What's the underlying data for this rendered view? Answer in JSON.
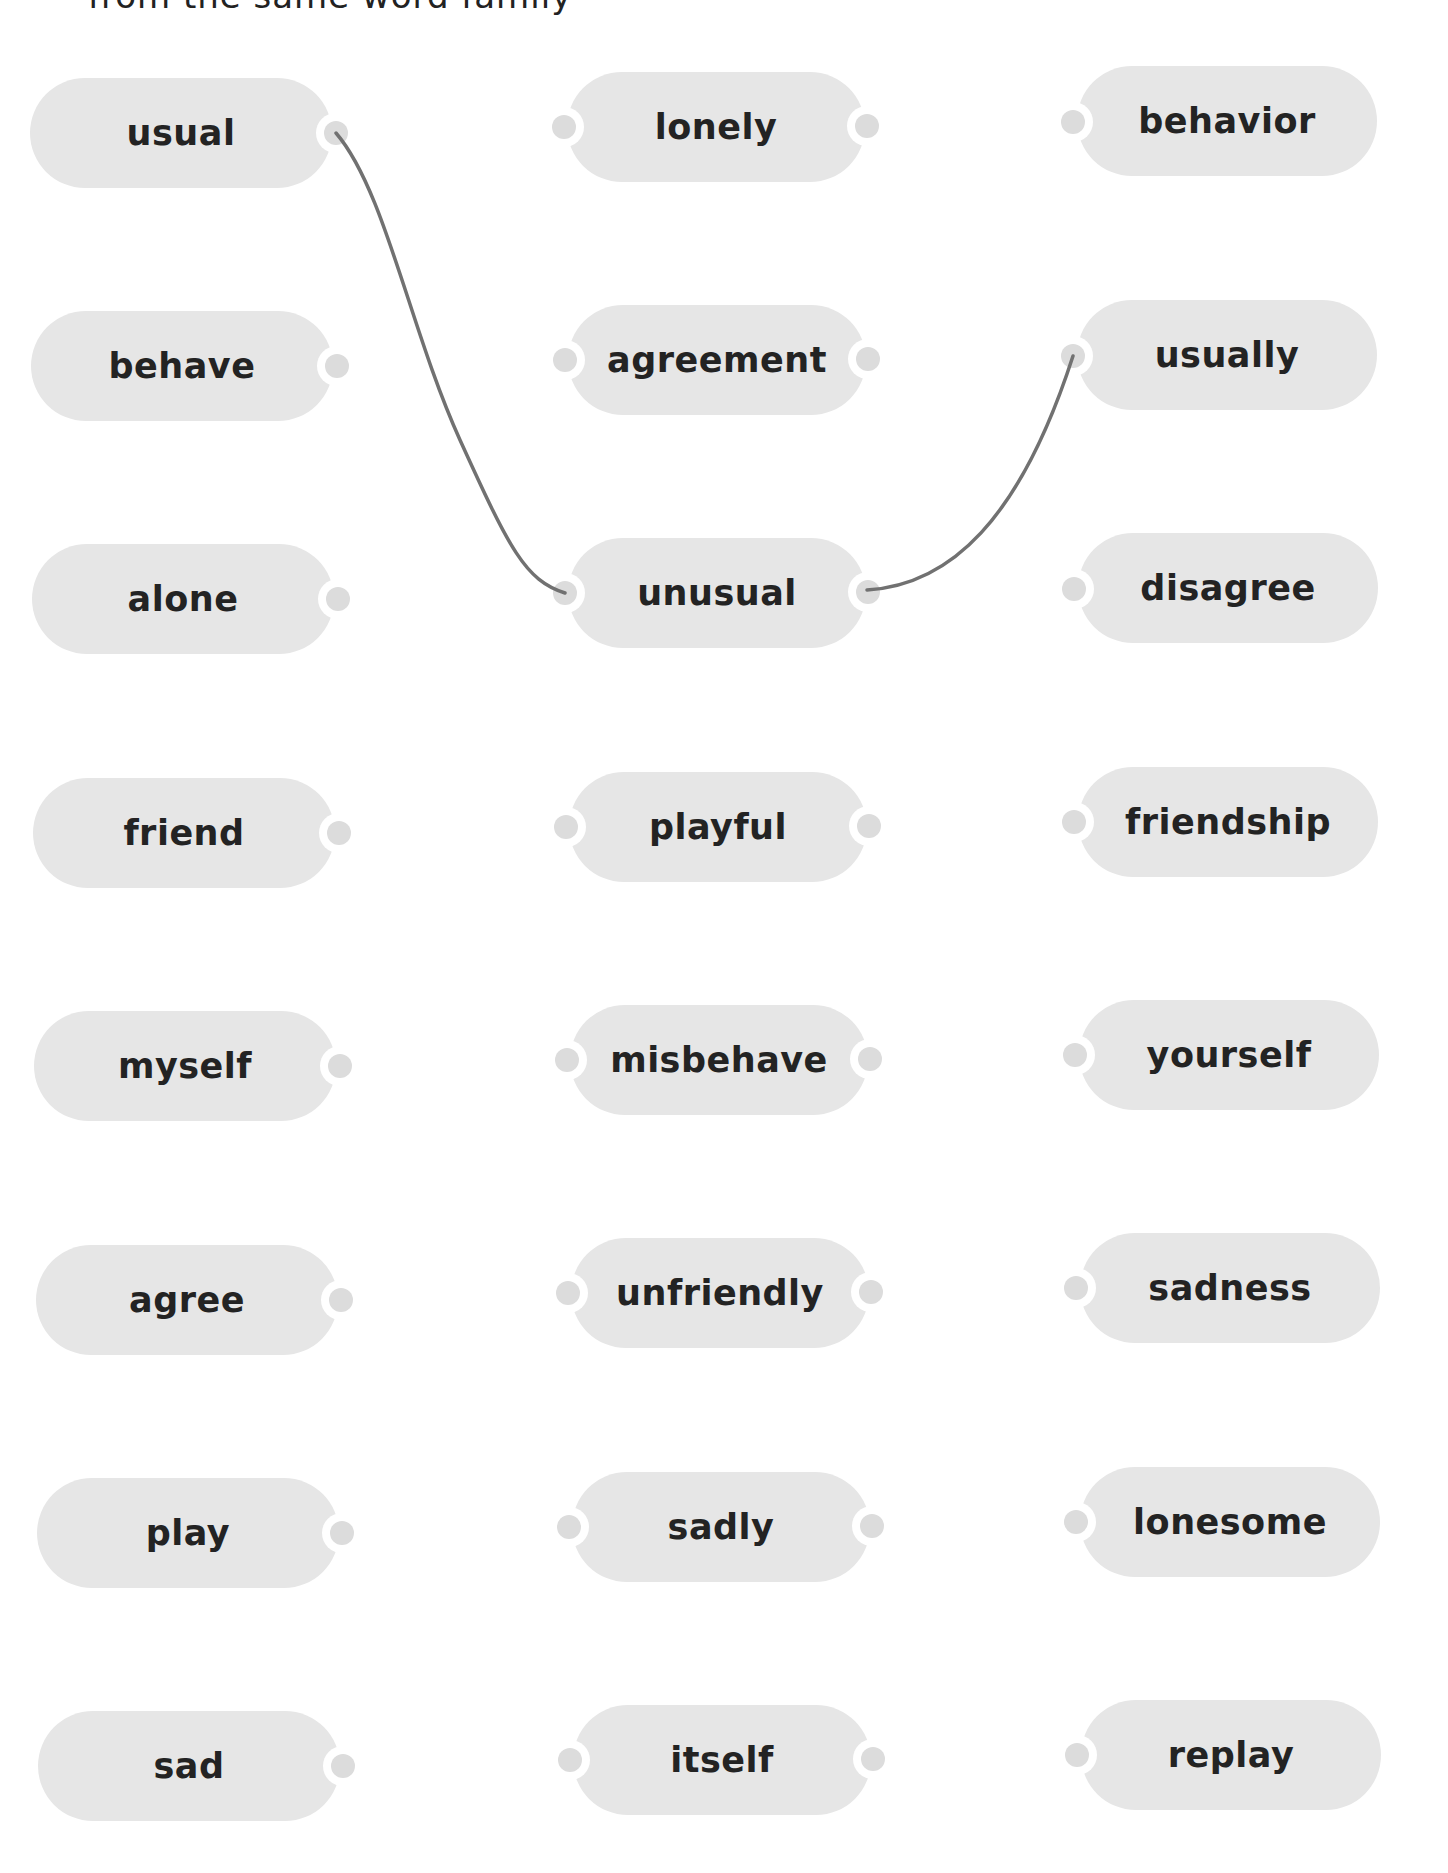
{
  "instruction": "from the same word family",
  "columns": {
    "left": [
      {
        "word": "usual"
      },
      {
        "word": "behave"
      },
      {
        "word": "alone"
      },
      {
        "word": "friend"
      },
      {
        "word": "myself"
      },
      {
        "word": "agree"
      },
      {
        "word": "play"
      },
      {
        "word": "sad"
      }
    ],
    "middle": [
      {
        "word": "lonely"
      },
      {
        "word": "agreement"
      },
      {
        "word": "unusual"
      },
      {
        "word": "playful"
      },
      {
        "word": "misbehave"
      },
      {
        "word": "unfriendly"
      },
      {
        "word": "sadly"
      },
      {
        "word": "itself"
      }
    ],
    "right": [
      {
        "word": "behavior"
      },
      {
        "word": "usually"
      },
      {
        "word": "disagree"
      },
      {
        "word": "friendship"
      },
      {
        "word": "yourself"
      },
      {
        "word": "sadness"
      },
      {
        "word": "lonesome"
      },
      {
        "word": "replay"
      }
    ]
  },
  "connections": [
    {
      "from": "usual",
      "to": "unusual"
    },
    {
      "from": "unusual",
      "to": "usually"
    }
  ],
  "colors": {
    "card_bg": "#e6e6e6",
    "text": "#232323",
    "connector_ring": "#ffffff",
    "connector_dot": "#dcdcdc",
    "line": "#717171"
  }
}
